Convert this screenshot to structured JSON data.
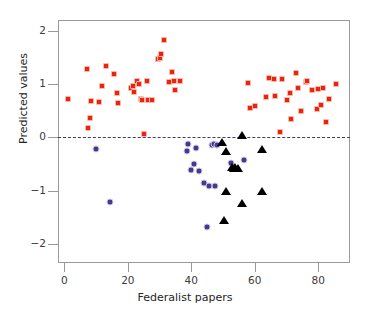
{
  "chart_data": {
    "type": "scatter",
    "title": "",
    "xlabel": "Federalist papers",
    "ylabel": "Predicted values",
    "xlim": [
      -2,
      90
    ],
    "ylim": [
      -2.35,
      2.2
    ],
    "xticks": [
      0,
      20,
      40,
      60,
      80
    ],
    "yticks": [
      2,
      1,
      0,
      -1,
      -2
    ],
    "xtick_labels": [
      "0",
      "20",
      "40",
      "60",
      "80"
    ],
    "ytick_labels": [
      "2",
      "1",
      "0",
      "−1",
      "−2"
    ],
    "grid": false,
    "legend": "none",
    "reference_lines": [
      {
        "name": "zero-line",
        "axis": "y",
        "value": 0,
        "style": "dashed",
        "color": "#3a3a6e"
      }
    ],
    "series": [
      {
        "name": "Hamilton",
        "marker": "square",
        "color": "#ee2211",
        "points": [
          [
            1,
            0.73
          ],
          [
            7,
            1.28
          ],
          [
            7.5,
            0.17
          ],
          [
            8,
            0.37
          ],
          [
            8.5,
            0.68
          ],
          [
            11,
            0.66
          ],
          [
            12,
            0.97
          ],
          [
            13,
            1.34
          ],
          [
            15.5,
            1.19
          ],
          [
            16.5,
            0.84
          ],
          [
            17,
            0.65
          ],
          [
            21,
            0.93
          ],
          [
            21.5,
            0.97
          ],
          [
            22,
            0.86
          ],
          [
            23,
            1.06
          ],
          [
            23.5,
            1.0
          ],
          [
            24,
            0.73
          ],
          [
            24.5,
            0.7
          ],
          [
            25,
            0.07
          ],
          [
            26,
            1.05
          ],
          [
            26.5,
            0.71
          ],
          [
            27.5,
            0.7
          ],
          [
            29.5,
            1.47
          ],
          [
            30,
            1.49
          ],
          [
            30.5,
            1.56
          ],
          [
            31.5,
            1.83
          ],
          [
            33,
            1.04
          ],
          [
            34,
            1.23
          ],
          [
            34.5,
            1.05
          ],
          [
            35,
            0.88
          ],
          [
            36.5,
            1.06
          ],
          [
            58,
            1.02
          ],
          [
            58.5,
            0.55
          ],
          [
            60,
            0.59
          ],
          [
            63.5,
            0.75
          ],
          [
            64.5,
            1.12
          ],
          [
            66,
            1.09
          ],
          [
            66.5,
            0.78
          ],
          [
            68,
            0.1
          ],
          [
            68.5,
            1.09
          ],
          [
            70,
            0.7
          ],
          [
            71,
            0.84
          ],
          [
            71.5,
            0.34
          ],
          [
            73,
            1.21
          ],
          [
            73.5,
            0.92
          ],
          [
            74.5,
            0.5
          ],
          [
            76,
            1.03
          ],
          [
            76.5,
            1.06
          ],
          [
            78,
            0.88
          ],
          [
            79.5,
            0.54
          ],
          [
            80,
            0.9
          ],
          [
            81,
            0.61
          ],
          [
            81.5,
            0.93
          ],
          [
            82.5,
            0.29
          ],
          [
            83.5,
            0.72
          ],
          [
            85.5,
            1.0
          ]
        ]
      },
      {
        "name": "Madison",
        "marker": "circle",
        "color": "#453a8e",
        "points": [
          [
            10,
            -0.22
          ],
          [
            14.5,
            -1.21
          ],
          [
            38.5,
            -0.26
          ],
          [
            39,
            -0.12
          ],
          [
            40,
            -0.6
          ],
          [
            41,
            -0.5
          ],
          [
            41.5,
            -0.19
          ],
          [
            42.5,
            -0.63
          ],
          [
            44,
            -0.85
          ],
          [
            45,
            -1.68
          ],
          [
            45.5,
            -0.9
          ],
          [
            46.5,
            -0.14
          ],
          [
            47,
            -0.13
          ],
          [
            47.5,
            -0.9
          ],
          [
            48,
            -0.14
          ],
          [
            52.5,
            -0.48
          ],
          [
            56.5,
            -0.43
          ]
        ]
      },
      {
        "name": "Disputed",
        "marker": "triangle",
        "color": "#000000",
        "points": [
          [
            49.5,
            -0.08
          ],
          [
            50.5,
            -0.25
          ],
          [
            50.5,
            -1.0
          ],
          [
            52.5,
            -0.55
          ],
          [
            53,
            -0.57
          ],
          [
            53.5,
            -0.55
          ],
          [
            54.5,
            -0.57
          ],
          [
            55.5,
            0.04
          ],
          [
            55.5,
            -1.23
          ],
          [
            50,
            -1.54
          ],
          [
            62,
            -0.22
          ],
          [
            62,
            -1.0
          ]
        ]
      }
    ]
  }
}
